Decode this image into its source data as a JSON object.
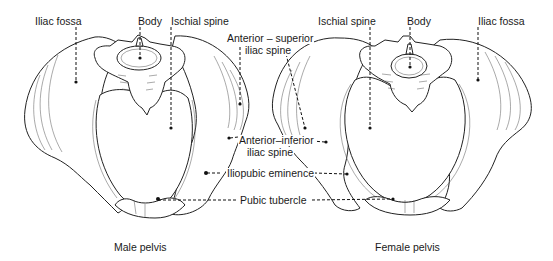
{
  "figure": {
    "male": {
      "caption": "Male pelvis",
      "labels": {
        "iliac_fossa": "Iliac fossa",
        "body": "Body",
        "ischial_spine": "Ischial spine"
      }
    },
    "female": {
      "caption": "Female pelvis",
      "labels": {
        "ischial_spine": "Ischial spine",
        "body": "Body",
        "iliac_fossa": "Iliac fossa"
      }
    },
    "shared_labels": {
      "anterior_superior_line1": "Anterior – superior",
      "anterior_superior_line2": "iliac spine",
      "anterior_inferior_line1": "Anterior–inferior",
      "anterior_inferior_line2": "iliac spine",
      "iliopubic_eminence": "Iliopubic eminence",
      "pubic_tubercle": "Pubic tubercle"
    }
  }
}
